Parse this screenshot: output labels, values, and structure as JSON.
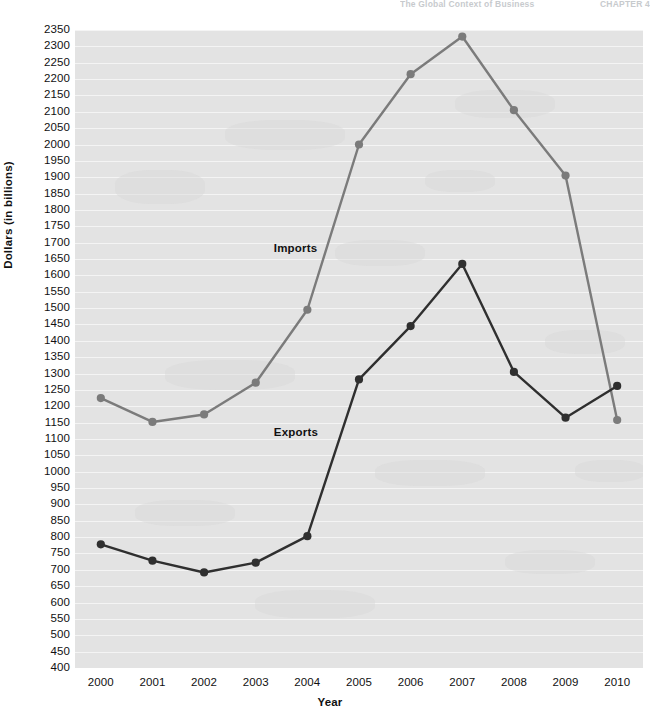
{
  "running_header": {
    "left_text": "The Global Context of Business",
    "right_text": "CHAPTER 4"
  },
  "chart_data": {
    "type": "line",
    "title": "",
    "xlabel": "Year",
    "ylabel": "Dollars (in billions)",
    "categories": [
      "2000",
      "2001",
      "2002",
      "2003",
      "2004",
      "2005",
      "2006",
      "2007",
      "2008",
      "2009",
      "2010"
    ],
    "ylim": [
      400,
      2350
    ],
    "ytick_step": 50,
    "yticks": [
      2350,
      2300,
      2250,
      2200,
      2150,
      2100,
      2050,
      2000,
      1950,
      1900,
      1850,
      1800,
      1750,
      1700,
      1650,
      1600,
      1550,
      1500,
      1450,
      1400,
      1350,
      1300,
      1250,
      1200,
      1150,
      1100,
      1050,
      1000,
      950,
      900,
      850,
      800,
      750,
      700,
      650,
      600,
      550,
      500,
      450,
      400
    ],
    "grid": true,
    "grid_axis": "y",
    "legend_position": "inline",
    "series": [
      {
        "name": "Imports",
        "color": "#7b7b7b",
        "values": [
          1225,
          1152,
          1175,
          1272,
          1495,
          2000,
          2215,
          2330,
          2105,
          1905,
          1158
        ],
        "label_x": 2003.35,
        "label_y": 1680
      },
      {
        "name": "Exports",
        "color": "#2f2f2f",
        "values": [
          778,
          728,
          692,
          722,
          803,
          1282,
          1445,
          1635,
          1305,
          1165,
          1262
        ],
        "label_x": 2003.35,
        "label_y": 1118
      }
    ]
  },
  "style": {
    "plot_background": "#e3e3e3",
    "gridline_color": "#f4f4f4",
    "text_color": "#111111"
  }
}
